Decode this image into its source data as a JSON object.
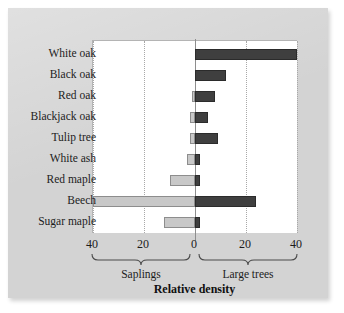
{
  "chart_data": {
    "type": "bar",
    "orientation": "horizontal-diverging",
    "title": "",
    "xlabel": "Relative density",
    "ylabel": "",
    "xlim": [
      -40,
      40
    ],
    "grid": true,
    "grid_axis": "x",
    "legend": "none",
    "categories": [
      "White oak",
      "Black oak",
      "Red oak",
      "Blackjack oak",
      "Tulip tree",
      "White ash",
      "Red maple",
      "Beech",
      "Sugar maple"
    ],
    "series": [
      {
        "name": "Saplings",
        "side": "left",
        "color": "#c8c8c8",
        "values": [
          0,
          0,
          1,
          2,
          2,
          3,
          10,
          40,
          12
        ]
      },
      {
        "name": "Large trees",
        "side": "right",
        "color": "#3f3f3f",
        "values": [
          40,
          12,
          8,
          5,
          9,
          2,
          2,
          24,
          2
        ]
      }
    ],
    "xticks": [
      {
        "value": -40,
        "label": "40"
      },
      {
        "value": -20,
        "label": "20"
      },
      {
        "value": 0,
        "label": "0"
      },
      {
        "value": 20,
        "label": "20"
      },
      {
        "value": 40,
        "label": "40"
      }
    ],
    "group_labels": [
      {
        "name": "saplings",
        "label": "Saplings",
        "side": "left"
      },
      {
        "name": "large-trees",
        "label": "Large trees",
        "side": "right"
      }
    ]
  },
  "colors": {
    "panel_background": "#d3d3d3",
    "plot_background": "#ffffff",
    "saplings_bar": "#c8c8c8",
    "large_trees_bar": "#3f3f3f",
    "gridline": "#a8a8a8",
    "axis_line": "#8e8e8e",
    "text": "#1c1c1c"
  }
}
